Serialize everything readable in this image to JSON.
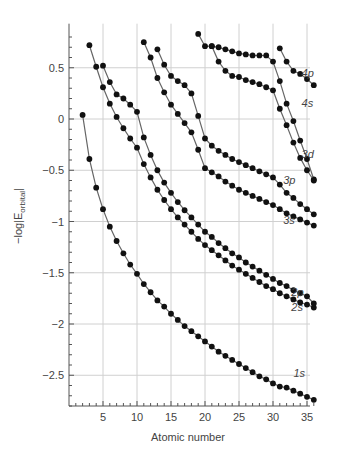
{
  "chart_data": {
    "type": "line",
    "title": "",
    "xlabel": "Atomic number",
    "ylabel": "-log|E_orbital|",
    "xlim": [
      0,
      37
    ],
    "ylim": [
      -2.8,
      0.93
    ],
    "xticks": [
      5,
      10,
      15,
      20,
      25,
      30,
      35
    ],
    "yticks": [
      0.5,
      0,
      -0.5,
      -1,
      -1.5,
      -2,
      -2.5
    ],
    "ytick_labels": [
      "0.5",
      "0",
      "−0.5",
      "−1",
      "−1.5",
      "−2",
      "−2.5"
    ],
    "grid": true,
    "series": [
      {
        "name": "1s",
        "label_pos": [
          33,
          -2.52
        ],
        "x": [
          2,
          3,
          4,
          5,
          6,
          7,
          8,
          9,
          10,
          11,
          12,
          13,
          14,
          15,
          16,
          17,
          18,
          19,
          20,
          21,
          22,
          23,
          24,
          25,
          26,
          27,
          28,
          29,
          30,
          31,
          32,
          33,
          34,
          35,
          36
        ],
        "values": [
          0.04,
          -0.39,
          -0.67,
          -0.88,
          -1.05,
          -1.19,
          -1.31,
          -1.42,
          -1.51,
          -1.61,
          -1.69,
          -1.77,
          -1.83,
          -1.9,
          -1.96,
          -2.02,
          -2.07,
          -2.12,
          -2.17,
          -2.22,
          -2.27,
          -2.31,
          -2.35,
          -2.39,
          -2.43,
          -2.47,
          -2.51,
          -2.54,
          -2.58,
          -2.61,
          -2.62,
          -2.65,
          -2.68,
          -2.71,
          -2.74
        ]
      },
      {
        "name": "2s",
        "label_pos": [
          32.7,
          -1.87
        ],
        "x": [
          3,
          4,
          5,
          6,
          7,
          8,
          9,
          10,
          11,
          12,
          13,
          14,
          15,
          16,
          17,
          18,
          19,
          20,
          21,
          22,
          23,
          24,
          25,
          26,
          27,
          28,
          29,
          30,
          31,
          32,
          33,
          34,
          35,
          36
        ],
        "values": [
          0.72,
          0.51,
          0.31,
          0.15,
          0.02,
          -0.09,
          -0.19,
          -0.28,
          -0.44,
          -0.57,
          -0.69,
          -0.79,
          -0.88,
          -0.96,
          -1.03,
          -1.1,
          -1.17,
          -1.23,
          -1.28,
          -1.33,
          -1.38,
          -1.43,
          -1.47,
          -1.51,
          -1.55,
          -1.59,
          -1.63,
          -1.66,
          -1.7,
          -1.73,
          -1.76,
          -1.79,
          -1.81,
          -1.84
        ]
      },
      {
        "name": "2p",
        "label_pos": [
          32.7,
          -1.73
        ],
        "x": [
          5,
          6,
          7,
          8,
          9,
          10,
          11,
          12,
          13,
          14,
          15,
          16,
          17,
          18,
          19,
          20,
          21,
          22,
          23,
          24,
          25,
          26,
          27,
          28,
          29,
          30,
          31,
          32,
          33,
          34,
          35,
          36
        ],
        "values": [
          0.52,
          0.36,
          0.24,
          0.2,
          0.14,
          0.07,
          -0.18,
          -0.35,
          -0.5,
          -0.62,
          -0.72,
          -0.81,
          -0.89,
          -0.96,
          -1.03,
          -1.1,
          -1.15,
          -1.21,
          -1.26,
          -1.31,
          -1.35,
          -1.4,
          -1.44,
          -1.48,
          -1.52,
          -1.56,
          -1.6,
          -1.63,
          -1.67,
          -1.7,
          -1.73,
          -1.8
        ]
      },
      {
        "name": "3s",
        "label_pos": [
          31.5,
          -1.02
        ],
        "x": [
          11,
          12,
          13,
          14,
          15,
          16,
          17,
          18,
          19,
          20,
          21,
          22,
          23,
          24,
          25,
          26,
          27,
          28,
          29,
          30,
          31,
          32,
          33,
          34,
          35,
          36
        ],
        "values": [
          0.75,
          0.6,
          0.4,
          0.26,
          0.14,
          0.05,
          -0.04,
          -0.13,
          -0.3,
          -0.48,
          -0.52,
          -0.56,
          -0.61,
          -0.65,
          -0.69,
          -0.72,
          -0.75,
          -0.78,
          -0.81,
          -0.84,
          -0.88,
          -0.92,
          -0.95,
          -0.98,
          -1.01,
          -1.04
        ]
      },
      {
        "name": "3p",
        "label_pos": [
          31.5,
          -0.63
        ],
        "x": [
          13,
          14,
          15,
          16,
          17,
          18,
          19,
          20,
          21,
          22,
          23,
          24,
          25,
          26,
          27,
          28,
          29,
          30,
          31,
          32,
          33,
          34,
          35,
          36
        ],
        "values": [
          0.68,
          0.53,
          0.42,
          0.37,
          0.33,
          0.25,
          0.03,
          -0.19,
          -0.26,
          -0.31,
          -0.35,
          -0.39,
          -0.42,
          -0.45,
          -0.48,
          -0.51,
          -0.54,
          -0.57,
          -0.64,
          -0.72,
          -0.77,
          -0.83,
          -0.88,
          -0.93
        ]
      },
      {
        "name": "3d",
        "label_pos": [
          34.2,
          -0.38
        ],
        "x": [
          21,
          22,
          23,
          24,
          25,
          26,
          27,
          28,
          29,
          30,
          31,
          32,
          33,
          34,
          35,
          36
        ],
        "values": [
          0.71,
          0.7,
          0.68,
          0.66,
          0.64,
          0.63,
          0.62,
          0.62,
          0.62,
          0.56,
          0.37,
          0.15,
          -0.02,
          -0.21,
          -0.39,
          -0.59
        ]
      },
      {
        "name": "4s",
        "label_pos": [
          34.2,
          0.12
        ],
        "x": [
          19,
          20,
          21,
          22,
          23,
          24,
          25,
          26,
          27,
          28,
          29,
          30,
          31,
          32,
          33,
          34,
          35,
          36
        ],
        "values": [
          0.83,
          0.71,
          0.71,
          0.56,
          0.47,
          0.42,
          0.41,
          0.38,
          0.36,
          0.34,
          0.31,
          0.28,
          0.1,
          -0.06,
          -0.23,
          -0.38,
          -0.5,
          -0.6
        ]
      },
      {
        "name": "4p",
        "label_pos": [
          34.2,
          0.41
        ],
        "x": [
          31,
          32,
          33,
          34,
          35,
          36
        ],
        "values": [
          0.69,
          0.56,
          0.47,
          0.44,
          0.39,
          0.33
        ]
      }
    ]
  }
}
